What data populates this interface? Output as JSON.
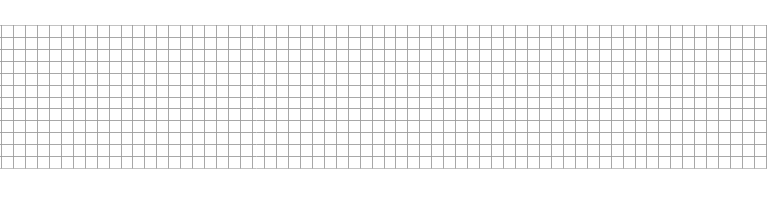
{
  "grid_paper": {
    "description": "Blank square grid paper",
    "line_color": "#9a9a9a",
    "background_color": "#ffffff",
    "columns": 64,
    "rows": 12
  }
}
